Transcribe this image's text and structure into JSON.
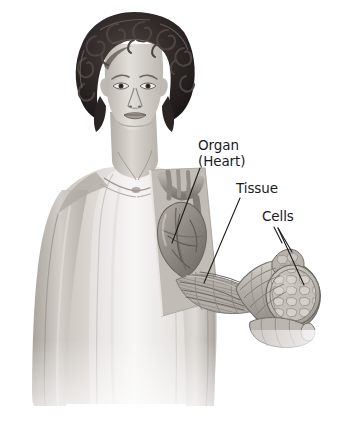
{
  "figure": {
    "kind": "anatomical-illustration",
    "style": "grayscale-pencil-rendering",
    "background_color": "#ffffff",
    "text_color": "#1a1a1a",
    "leader_line_color": "#1c1c1c"
  },
  "labels": {
    "organ": {
      "line1": "Organ",
      "line2": "(Heart)"
    },
    "tissue": "Tissue",
    "cells": "Cells"
  },
  "palette": {
    "ink": "#1a1a1a",
    "hair_dark": "#241f1d",
    "hair_mid": "#3d3533",
    "skin_light": "#e6e2de",
    "skin_mid": "#c9c3bd",
    "skin_shadow": "#a49d97",
    "garment": "#f2f1ef",
    "organ_mid": "#9e9892",
    "organ_dark": "#6f6a66",
    "tissue_mid": "#b4aea8",
    "cells_light": "#cfc9c3",
    "cells_mid": "#a8a29c"
  }
}
